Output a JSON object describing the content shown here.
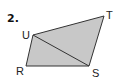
{
  "problem": {
    "number": "2."
  },
  "figure": {
    "fill_color": "#c8c8c8",
    "stroke_color": "#333333",
    "vertices": {
      "U": {
        "label": "U",
        "x": 33,
        "y": 35
      },
      "T": {
        "label": "T",
        "x": 104,
        "y": 16
      },
      "S": {
        "label": "S",
        "x": 89,
        "y": 66
      },
      "R": {
        "label": "R",
        "x": 26,
        "y": 66
      }
    },
    "diagonal": [
      "U",
      "S"
    ],
    "labels": {
      "U": "U",
      "T": "T",
      "R": "R",
      "S": "S"
    }
  }
}
